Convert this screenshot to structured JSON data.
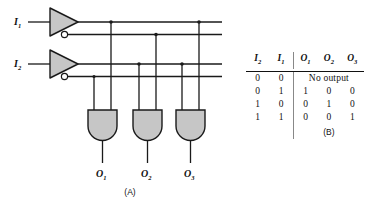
{
  "figure": {
    "panel_a_caption": "(A)",
    "panel_b_caption": "(B)",
    "background": "#ffffff",
    "line_color": "#1a1a1a",
    "gate_fill": "#c9c9c9"
  },
  "circuit": {
    "inputs": [
      {
        "name": "I1",
        "label": "I",
        "subscript": "1"
      },
      {
        "name": "I2",
        "label": "I",
        "subscript": "2"
      }
    ],
    "outputs": [
      {
        "name": "O1",
        "label": "O",
        "subscript": "1"
      },
      {
        "name": "O2",
        "label": "O",
        "subscript": "2"
      },
      {
        "name": "O3",
        "label": "O",
        "subscript": "3"
      }
    ],
    "gates": [
      {
        "type": "buffer-inverter",
        "name": "inverter-1"
      },
      {
        "type": "buffer-inverter",
        "name": "inverter-2"
      },
      {
        "type": "and",
        "name": "and-gate-1"
      },
      {
        "type": "and",
        "name": "and-gate-2"
      },
      {
        "type": "and",
        "name": "and-gate-3"
      }
    ],
    "bus_count": 4
  },
  "truth_table": {
    "headers": [
      "I2",
      "I1",
      "O1",
      "O2",
      "O3"
    ],
    "header_display": [
      {
        "base": "I",
        "sub": "2"
      },
      {
        "base": "I",
        "sub": "1"
      },
      {
        "base": "O",
        "sub": "1"
      },
      {
        "base": "O",
        "sub": "2"
      },
      {
        "base": "O",
        "sub": "3"
      }
    ],
    "rows": [
      {
        "i2": "0",
        "i1": "0",
        "spanned": true,
        "span_text": "No output"
      },
      {
        "i2": "0",
        "i1": "1",
        "o1": "1",
        "o2": "0",
        "o3": "0"
      },
      {
        "i2": "1",
        "i1": "0",
        "o1": "0",
        "o2": "1",
        "o3": "0"
      },
      {
        "i2": "1",
        "i1": "1",
        "o1": "0",
        "o2": "0",
        "o3": "1"
      }
    ]
  }
}
